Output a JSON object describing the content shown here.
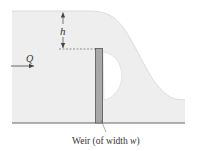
{
  "diagram": {
    "labels": {
      "head": "h",
      "flow_rate": "Q",
      "weir_caption_prefix": "Weir (of width ",
      "weir_caption_var": "w",
      "weir_caption_suffix": ")"
    },
    "colors": {
      "water_fill": "#eeeeee",
      "water_surface": "#d6d6d6",
      "weir_fill": "#a8a8a8",
      "weir_stroke": "#555555",
      "channel_bottom": "#666666",
      "text": "#333333",
      "arrow": "#444444"
    },
    "elements": [
      "upstream-water-surface",
      "head-dimension-arrow",
      "weir-crest-dashed-line",
      "flow-arrow",
      "weir-plate",
      "nappe-air-pocket",
      "downstream-water",
      "channel-bottom",
      "weir-leader-line"
    ]
  }
}
